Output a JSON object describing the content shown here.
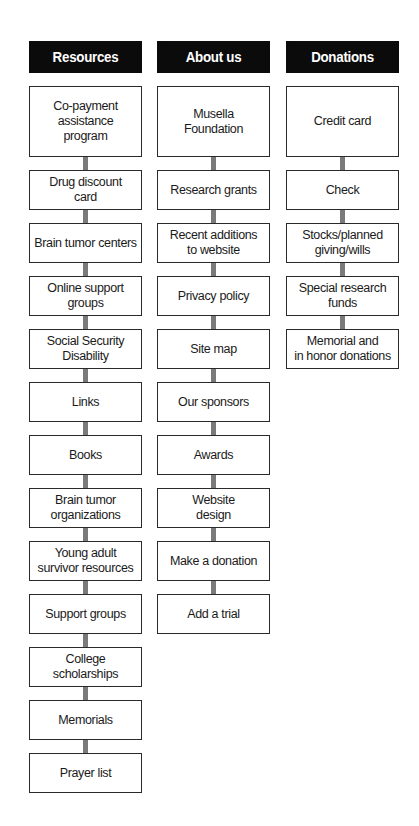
{
  "diagram": {
    "columns": [
      {
        "header": "Resources",
        "items": [
          "Co-payment\nassistance\nprogram",
          "Drug discount\ncard",
          "Brain tumor centers",
          "Online support\ngroups",
          "Social Security\nDisability",
          "Links",
          "Books",
          "Brain tumor\norganizations",
          "Young adult\nsurvivor resources",
          "Support groups",
          "College\nscholarships",
          "Memorials",
          "Prayer list"
        ]
      },
      {
        "header": "About us",
        "items": [
          "Musella\nFoundation",
          "Research grants",
          "Recent additions\nto website",
          "Privacy policy",
          "Site map",
          "Our sponsors",
          "Awards",
          "Website\ndesign",
          "Make a donation",
          "Add a trial"
        ]
      },
      {
        "header": "Donations",
        "items": [
          "Credit card",
          "Check",
          "Stocks/planned\ngiving/wills",
          "Special research\nfunds",
          "Memorial and\nin honor donations"
        ]
      }
    ],
    "colors": {
      "header_bg": "#0b0b0b",
      "header_text": "#ffffff",
      "node_border": "#2a2a2a",
      "connector": "#7a7a7a"
    }
  }
}
